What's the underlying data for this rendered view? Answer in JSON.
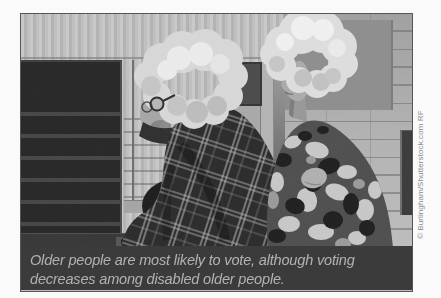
{
  "palette": {
    "page_bg": "#fafafa",
    "frame_border": "#565656",
    "caption_bg": "#3b3b3b",
    "caption_text": "#b2b2b2",
    "credit_text": "#8a8a8a"
  },
  "figure": {
    "caption": {
      "line1": "Older people are most likely to vote, although voting",
      "line2": "decreases among disabled older people."
    },
    "credit": "© Burlingham/Shutterstock.com RF"
  }
}
